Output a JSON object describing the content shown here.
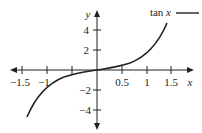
{
  "chart_data": {
    "type": "line",
    "title": "",
    "xlabel": "x",
    "ylabel": "y",
    "xlim": [
      -1.75,
      1.9
    ],
    "ylim": [
      -5.7,
      5.8
    ],
    "grid": false,
    "legend_position": "top-right",
    "x_ticks": [
      -1.5,
      -1,
      -0.5,
      0.5,
      1,
      1.5
    ],
    "x_tick_labels": [
      "-1.5",
      "-1",
      "",
      "0.5",
      "1",
      "1.5"
    ],
    "y_ticks": [
      4,
      2,
      -2,
      -4
    ],
    "y_tick_labels": [
      "4",
      "2",
      "−2",
      "−4"
    ],
    "series": [
      {
        "name": "tan x",
        "color": "#222222",
        "x": [
          -1.37,
          -1.3,
          -1.2,
          -1.1,
          -1.0,
          -0.8,
          -0.6,
          -0.4,
          -0.2,
          0,
          0.2,
          0.4,
          0.6,
          0.8,
          1.0,
          1.1,
          1.2,
          1.3,
          1.37
        ],
        "y": [
          -4.93,
          -3.6,
          -2.57,
          -1.96,
          -1.56,
          -1.03,
          -0.68,
          -0.42,
          -0.2,
          0,
          0.2,
          0.42,
          0.68,
          1.03,
          1.56,
          1.96,
          2.57,
          3.6,
          4.93
        ]
      }
    ]
  },
  "labels": {
    "x_axis": "x",
    "y_axis": "y",
    "legend": "tan x",
    "xt_m15": "−1.5",
    "xt_m1": "−1",
    "xt_05": "0.5",
    "xt_1": "1",
    "xt_15": "1.5",
    "yt_4": "4",
    "yt_2": "2",
    "yt_m2": "−2",
    "yt_m4": "−4"
  }
}
